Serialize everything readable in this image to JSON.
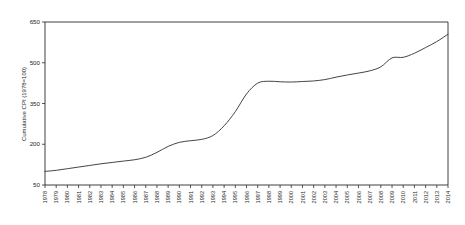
{
  "chart_data": {
    "type": "line",
    "title": "",
    "subtitle": "",
    "xlabel": "",
    "ylabel": "Cumulative CPI (1978=100)",
    "ylim": [
      50,
      650
    ],
    "xlim": [
      1978,
      2014
    ],
    "grid": false,
    "legend": null,
    "legend_position": "none",
    "yticks": [
      50,
      200,
      350,
      500,
      650
    ],
    "ytick_labels": [
      "50",
      "200",
      "350",
      "500",
      "650"
    ],
    "series_color": "#3a3a3a",
    "x": [
      1978,
      1979,
      1980,
      1981,
      1982,
      1983,
      1984,
      1985,
      1986,
      1987,
      1988,
      1989,
      1990,
      1991,
      1992,
      1993,
      1994,
      1995,
      1996,
      1997,
      1998,
      1999,
      2000,
      2001,
      2002,
      2003,
      2004,
      2005,
      2006,
      2007,
      2008,
      2009,
      2010,
      2011,
      2012,
      2013,
      2014
    ],
    "categories": [
      "1978",
      "1979",
      "1980",
      "1981",
      "1982",
      "1983",
      "1984",
      "1985",
      "1986",
      "1987",
      "1988",
      "1989",
      "1990",
      "1991",
      "1992",
      "1993",
      "1994",
      "1995",
      "1996",
      "1997",
      "1998",
      "1999",
      "2000",
      "2001",
      "2002",
      "2003",
      "2004",
      "2005",
      "2006",
      "2007",
      "2008",
      "2009",
      "2010",
      "2011",
      "2012",
      "2013",
      "2014"
    ],
    "values": [
      100,
      104,
      110,
      116,
      122,
      128,
      133,
      138,
      143,
      152,
      170,
      192,
      207,
      213,
      218,
      232,
      268,
      320,
      385,
      425,
      432,
      430,
      429,
      431,
      433,
      438,
      447,
      455,
      462,
      470,
      485,
      518,
      520,
      535,
      556,
      578,
      605
    ],
    "series": [
      {
        "name": "Cumulative CPI",
        "values": [
          100,
          104,
          110,
          116,
          122,
          128,
          133,
          138,
          143,
          152,
          170,
          192,
          207,
          213,
          218,
          232,
          268,
          320,
          385,
          425,
          432,
          430,
          429,
          431,
          433,
          438,
          447,
          455,
          462,
          470,
          485,
          518,
          520,
          535,
          556,
          578,
          605
        ]
      }
    ]
  }
}
